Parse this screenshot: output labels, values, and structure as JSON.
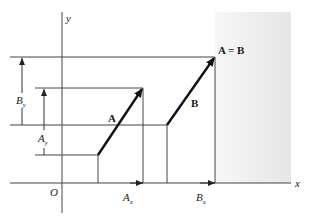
{
  "figure": {
    "colors": {
      "line": "#3a3a3a",
      "vector": "#111111",
      "shade": "#ececec",
      "background": "#ffffff"
    }
  },
  "axes": {
    "x_label": "x",
    "y_label": "y",
    "origin_label": "O"
  },
  "vectors": {
    "a_label": "A",
    "b_label": "B",
    "equality_label": "A = B"
  },
  "components": {
    "ax": {
      "main": "A",
      "sub": "x"
    },
    "bx": {
      "main": "B",
      "sub": "x"
    },
    "ay": {
      "main": "A",
      "sub": "y"
    },
    "by": {
      "main": "B",
      "sub": "y"
    }
  }
}
